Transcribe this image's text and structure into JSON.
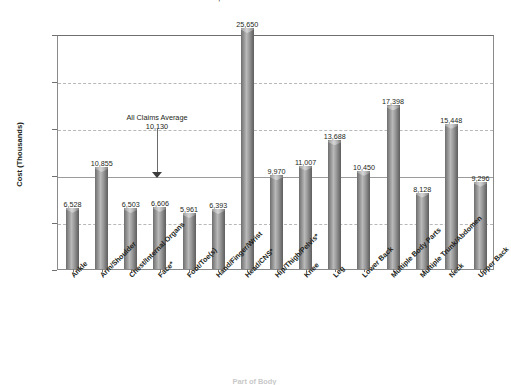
{
  "title": "AVERAGE COST OF CLAIMS BY PART OF BODY, 1997-1998",
  "axis": {
    "ylabel": "Cost (Thousands)",
    "xlabel": "Part of Body",
    "yticks": [
      "$0",
      "$5",
      "$10",
      "$15",
      "$20",
      "$25"
    ]
  },
  "annotation": {
    "line1": "All Claims Average",
    "line2": "10,130"
  },
  "chart_data": {
    "type": "bar",
    "title": "AVERAGE COST OF CLAIMS BY PART OF BODY, 1997-1998",
    "xlabel": "Part of Body",
    "ylabel": "Cost (Thousands)",
    "ylim": [
      0,
      25000
    ],
    "ytick_values": [
      0,
      5000,
      10000,
      15000,
      20000,
      25000
    ],
    "ytick_labels": [
      "$0",
      "$5",
      "$10",
      "$15",
      "$20",
      "$25"
    ],
    "grid": "horizontal-dashed",
    "legend": "none",
    "reference_line": {
      "label": "All Claims Average",
      "value": 10130
    },
    "categories": [
      "Ankle",
      "Arm/Shoulder",
      "Chest/Internal Organs",
      "Face*",
      "Foot/Toe(s)",
      "Hand/Finger/Wrist",
      "Head/CNS*",
      "Hip/Thigh/Pelvis*",
      "Knee",
      "Leg",
      "Lower Back",
      "Multiple Body Parts",
      "Multiple Trunk/Abdomen",
      "Neck",
      "Upper Back"
    ],
    "values": [
      6528,
      10855,
      6503,
      6606,
      5961,
      6393,
      25650,
      9970,
      11007,
      13688,
      10450,
      17398,
      8128,
      15448,
      9296
    ],
    "value_labels": [
      "6,528",
      "10,855",
      "6,503",
      "6,606",
      "5,961",
      "6,393",
      "25,650",
      "9,970",
      "11,007",
      "13,688",
      "10,450",
      "17,398",
      "8,128",
      "15,448",
      "9,296"
    ]
  }
}
